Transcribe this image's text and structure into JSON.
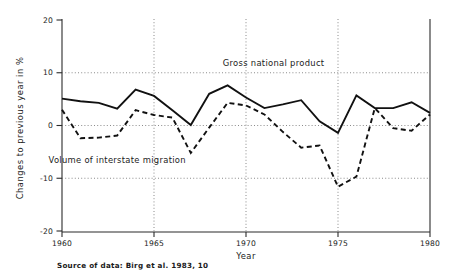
{
  "chart_data": {
    "type": "line",
    "title": "",
    "xlabel": "Year",
    "ylabel": "Changes to previous year in %",
    "xlim": [
      1960,
      1980
    ],
    "ylim": [
      -20,
      20
    ],
    "yticks": [
      20,
      10,
      0,
      -10,
      -20
    ],
    "ytick_labels": [
      "20",
      "10",
      "0",
      "-10",
      "-20"
    ],
    "xticks": [
      1960,
      1965,
      1970,
      1975,
      1980
    ],
    "xtick_labels": [
      "1960",
      "1965",
      "1970",
      "1975",
      "1980"
    ],
    "grid": "dotted gridlines at y = 10, 0, -10 and x = 1965, 1970, 1975",
    "legend_position": "inline annotations on plot",
    "x": [
      1960,
      1961,
      1962,
      1963,
      1964,
      1965,
      1966,
      1967,
      1968,
      1969,
      1970,
      1971,
      1972,
      1973,
      1974,
      1975,
      1976,
      1977,
      1978,
      1979,
      1980
    ],
    "series": [
      {
        "name": "Gross national product",
        "style": "solid",
        "values": [
          5.1,
          4.6,
          4.3,
          3.2,
          6.8,
          5.6,
          2.9,
          0.1,
          6.0,
          7.6,
          5.3,
          3.3,
          4.0,
          4.8,
          0.8,
          -1.4,
          5.7,
          3.3,
          3.3,
          4.4,
          2.4
        ]
      },
      {
        "name": "Volume of interstate migration",
        "style": "dashed",
        "values": [
          3.0,
          -2.4,
          -2.3,
          -1.9,
          2.9,
          2.0,
          1.5,
          -5.2,
          -0.4,
          4.3,
          3.8,
          2.1,
          -1.2,
          -4.2,
          -3.8,
          -11.6,
          -9.7,
          3.3,
          -0.5,
          -1.0,
          2.1
        ]
      }
    ],
    "annotations": [
      {
        "name": "gross-national-product-label",
        "text": "Gross national product",
        "x": 1971.5,
        "y": 11.2
      },
      {
        "name": "volume-of-interstate-migration-label",
        "text": "Volume of interstate migration",
        "x": 1963.0,
        "y": -7.2
      }
    ],
    "caption": "Source of data: Birg et al. 1983, 10"
  }
}
